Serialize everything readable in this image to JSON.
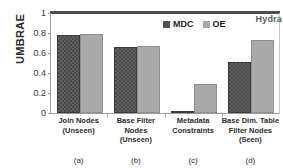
{
  "chart_data": {
    "type": "bar",
    "title": "",
    "xlabel": "",
    "ylabel": "UMBRAE",
    "ylim": [
      0,
      1
    ],
    "yticks": [
      "0",
      "0.2",
      "0.4",
      "0.6",
      "0.8",
      "1"
    ],
    "ytick_values": [
      0,
      0.2,
      0.4,
      0.6,
      0.8,
      1
    ],
    "grid": false,
    "legend_position": "top-center",
    "categories": [
      "Join Nodes (Unseen)",
      "Base Filter Nodes (Unseen)",
      "Metadata Constraints",
      "Base Dim. Table Filter Nodes (Seen)"
    ],
    "category_lines": [
      [
        "Join Nodes",
        "(Unseen)"
      ],
      [
        "Base Filter",
        "Nodes",
        "(Unseen)"
      ],
      [
        "Metadata",
        "Constraints"
      ],
      [
        "Base Dim. Table",
        "Filter Nodes",
        "(Seen)"
      ]
    ],
    "captions": [
      "(a)",
      "(b)",
      "(c)",
      "(d)"
    ],
    "series": [
      {
        "name": "MDC",
        "color": "#4a4a4a",
        "values": [
          0.78,
          0.66,
          0.01,
          0.51
        ]
      },
      {
        "name": "OE",
        "color": "#a9a9a9",
        "values": [
          0.79,
          0.67,
          0.29,
          0.73
        ]
      }
    ],
    "annotations": [
      {
        "name": "watermark",
        "text": "Hydra"
      }
    ]
  },
  "legend": {
    "items": [
      {
        "label": "MDC"
      },
      {
        "label": "OE"
      }
    ]
  },
  "watermark": {
    "text": "Hydra"
  }
}
